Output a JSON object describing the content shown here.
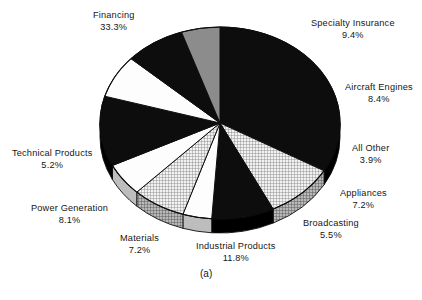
{
  "figure": {
    "caption": "(a)",
    "caption_x": 200,
    "caption_y": 268
  },
  "chart_data": {
    "type": "pie",
    "title": "",
    "subtitle": "",
    "xlabel": "",
    "ylabel": "",
    "legend_position": "none",
    "grid": false,
    "units": "percent",
    "total": 100.0,
    "labels": [
      "Financing",
      "Specialty Insurance",
      "Aircraft Engines",
      "All Other",
      "Appliances",
      "Broadcasting",
      "Industrial Products",
      "Materials",
      "Power Generation",
      "Technical Products"
    ],
    "values": [
      33.3,
      9.4,
      8.4,
      3.9,
      7.2,
      5.5,
      11.8,
      7.2,
      8.1,
      5.2
    ],
    "value_labels": [
      "33.3%",
      "9.4%",
      "8.4%",
      "3.9%",
      "7.2%",
      "5.5%",
      "11.8%",
      "7.2%",
      "8.1%",
      "5.2%"
    ],
    "slices": [
      {
        "name": "Financing",
        "value": 33.3,
        "value_label": "33.3%",
        "fill": "black",
        "color": "#0d0d0d",
        "label_x": 93,
        "label_y": 10,
        "label_align": "l"
      },
      {
        "name": "Specialty Insurance",
        "value": 9.4,
        "value_label": "9.4%",
        "fill": "grid",
        "color": "#d8d8d8",
        "label_x": 311,
        "label_y": 18,
        "label_align": "l"
      },
      {
        "name": "Aircraft Engines",
        "value": 8.4,
        "value_label": "8.4%",
        "fill": "black",
        "color": "#0d0d0d",
        "label_x": 345,
        "label_y": 82,
        "label_align": "l"
      },
      {
        "name": "All Other",
        "value": 3.9,
        "value_label": "3.9%",
        "fill": "white",
        "color": "#ffffff",
        "label_x": 352,
        "label_y": 143,
        "label_align": "l"
      },
      {
        "name": "Appliances",
        "value": 7.2,
        "value_label": "7.2%",
        "fill": "grid",
        "color": "#d8d8d8",
        "label_x": 340,
        "label_y": 188,
        "label_align": "l"
      },
      {
        "name": "Broadcasting",
        "value": 5.5,
        "value_label": "5.5%",
        "fill": "white",
        "color": "#ffffff",
        "label_x": 303,
        "label_y": 218,
        "label_align": "l"
      },
      {
        "name": "Industrial Products",
        "value": 11.8,
        "value_label": "11.8%",
        "fill": "black",
        "color": "#0d0d0d",
        "label_x": 196,
        "label_y": 241,
        "label_align": "l"
      },
      {
        "name": "Materials",
        "value": 7.2,
        "value_label": "7.2%",
        "fill": "white",
        "color": "#ffffff",
        "label_x": 120,
        "label_y": 233,
        "label_align": "l"
      },
      {
        "name": "Power Generation",
        "value": 8.1,
        "value_label": "8.1%",
        "fill": "black",
        "color": "#0d0d0d",
        "label_x": 31,
        "label_y": 203,
        "label_align": "l"
      },
      {
        "name": "Technical Products",
        "value": 5.2,
        "value_label": "5.2%",
        "fill": "gray",
        "color": "#8c8c8c",
        "label_x": 12,
        "label_y": 148,
        "label_align": "l"
      }
    ],
    "geometry": {
      "center_x": 220,
      "center_y": 123,
      "radius_x": 120,
      "radius_y": 96,
      "depth": 14,
      "start_angle_deg": -90,
      "direction": "clockwise"
    }
  }
}
